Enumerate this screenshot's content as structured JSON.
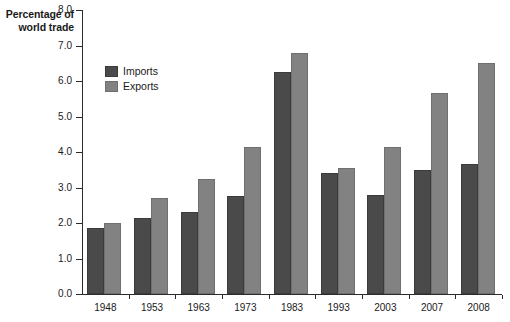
{
  "chart_data": {
    "type": "bar",
    "title": "Percentage of world trade",
    "title_line1": "Percentage of",
    "title_line2": "world trade",
    "xlabel": "",
    "ylabel": "Percentage of world trade",
    "ylim": [
      0.0,
      8.0
    ],
    "ytick_step": 1.0,
    "grid": false,
    "legend_position": "top-left-inside",
    "categories": [
      "1948",
      "1953",
      "1963",
      "1973",
      "1983",
      "1993",
      "2003",
      "2007",
      "2008"
    ],
    "ytick_labels": [
      "0.0",
      "1.0",
      "2.0",
      "3.0",
      "4.0",
      "5.0",
      "6.0",
      "7.0",
      "8.0"
    ],
    "series": [
      {
        "name": "Imports",
        "color": "#4a4a4a",
        "values": [
          1.85,
          2.15,
          2.3,
          2.75,
          6.25,
          3.4,
          2.8,
          3.5,
          3.65
        ]
      },
      {
        "name": "Exports",
        "color": "#828282",
        "values": [
          2.0,
          2.7,
          3.25,
          4.15,
          6.8,
          3.55,
          4.15,
          5.65,
          6.5
        ]
      }
    ]
  },
  "legend": {
    "items": [
      {
        "label": "Imports",
        "key": "imports"
      },
      {
        "label": "Exports",
        "key": "exports"
      }
    ]
  }
}
